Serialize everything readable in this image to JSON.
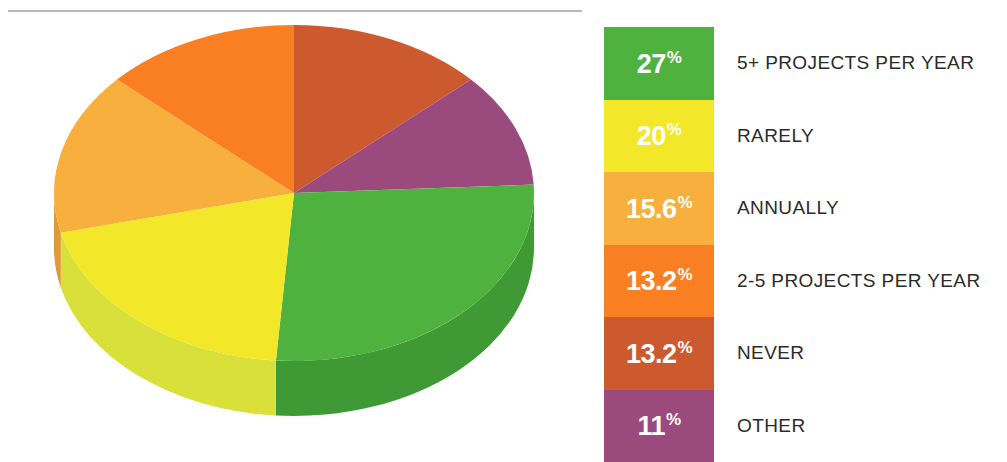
{
  "chart_data": {
    "type": "pie",
    "title": "",
    "subtitle": "",
    "xlabel": "",
    "ylabel": "",
    "legend_position": "right",
    "grid": false,
    "three_d": true,
    "start_angle_deg": 0,
    "direction": "clockwise",
    "categories": [
      "5+ PROJECTS PER YEAR",
      "RARELY",
      "ANNUALLY",
      "2-5 PROJECTS PER YEAR",
      "NEVER",
      "OTHER"
    ],
    "values": [
      27,
      20,
      15.6,
      13.2,
      13.2,
      11
    ],
    "value_labels": [
      "27%",
      "20%",
      "15.6%",
      "13.2%",
      "13.2%",
      "11%"
    ],
    "colors": [
      "#4FB23F",
      "#F2E829",
      "#F7AF3D",
      "#FA7E22",
      "#CC5A2E",
      "#9B4A7E"
    ],
    "slice_order_from_12oclock_clockwise": [
      "NEVER",
      "OTHER",
      "5+ PROJECTS PER YEAR",
      "RARELY",
      "ANNUALLY",
      "2-5 PROJECTS PER YEAR"
    ]
  },
  "legend": {
    "items": [
      {
        "value": "27",
        "suffix": "%",
        "label": "5+ PROJECTS PER YEAR",
        "color": "#4FB23F"
      },
      {
        "value": "20",
        "suffix": "%",
        "label": "RARELY",
        "color": "#F2E829"
      },
      {
        "value": "15.6",
        "suffix": "%",
        "label": "ANNUALLY",
        "color": "#F7AF3D"
      },
      {
        "value": "13.2",
        "suffix": "%",
        "label": "2-5 PROJECTS PER YEAR",
        "color": "#FA7E22"
      },
      {
        "value": "13.2",
        "suffix": "%",
        "label": "NEVER",
        "color": "#CC5A2E"
      },
      {
        "value": "11",
        "suffix": "%",
        "label": "OTHER",
        "color": "#9B4A7E"
      }
    ]
  },
  "pie": {
    "slices": [
      {
        "name": "NEVER",
        "color": "#CC5A2E",
        "side": "#B04F29",
        "start": 0,
        "sweep": 47.52
      },
      {
        "name": "OTHER",
        "color": "#9B4A7E",
        "side": "#85406C",
        "start": 47.52,
        "sweep": 39.6
      },
      {
        "name": "5+ PROJECTS PER YEAR",
        "color": "#4FB23F",
        "side": "#3F9A36",
        "start": 87.12,
        "sweep": 97.2
      },
      {
        "name": "RARELY",
        "color": "#F2E829",
        "side": "#D9E03A",
        "start": 184.32,
        "sweep": 72.0
      },
      {
        "name": "ANNUALLY",
        "color": "#F7AF3D",
        "side": "#DE9B35",
        "start": 256.32,
        "sweep": 56.16
      },
      {
        "name": "2-5 PROJECTS PER YEAR",
        "color": "#FA7E22",
        "side": "#DF6E1E",
        "start": 312.48,
        "sweep": 47.52
      }
    ]
  }
}
